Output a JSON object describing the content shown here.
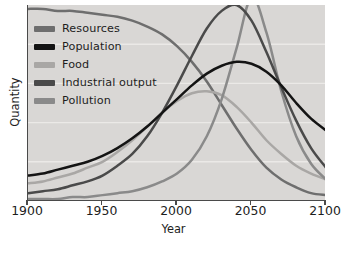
{
  "figure": {
    "background_color": "#ffffff",
    "plot_background_color": "#d9d7d5",
    "axis_color": "#4a4a4a",
    "gridline_color": "#ebe9e7"
  },
  "chart_data": {
    "type": "line",
    "title": "",
    "subtitle": "",
    "xlabel": "Year",
    "ylabel": "Quantity",
    "xlim": [
      1900,
      2100
    ],
    "ylim": [
      0,
      100
    ],
    "xticks": [
      1900,
      1950,
      2000,
      2050,
      2100
    ],
    "xtick_labels": [
      "1900",
      "1950",
      "2000",
      "2050",
      "2100"
    ],
    "yticks": [],
    "ytick_labels": [],
    "grid": true,
    "grid_axis": "y",
    "legend_position": "upper-left",
    "x": [
      1900,
      1910,
      1920,
      1930,
      1940,
      1950,
      1960,
      1970,
      1980,
      1990,
      2000,
      2010,
      2020,
      2030,
      2040,
      2050,
      2060,
      2070,
      2080,
      2090,
      2100
    ],
    "series": [
      {
        "name": "Resources",
        "color": "#6e6e6e",
        "values": [
          98,
          98,
          97,
          97,
          96,
          95,
          94,
          92,
          89,
          85,
          79,
          71,
          61,
          49,
          37,
          26,
          17,
          11,
          7,
          4,
          3
        ]
      },
      {
        "name": "Population",
        "color": "#141414",
        "values": [
          13,
          14,
          16,
          18,
          20,
          23,
          27,
          32,
          38,
          45,
          52,
          59,
          65,
          69,
          71,
          70,
          66,
          59,
          50,
          42,
          36
        ]
      },
      {
        "name": "Food",
        "color": "#a9a7a5",
        "values": [
          9,
          10,
          12,
          14,
          17,
          20,
          25,
          31,
          38,
          45,
          51,
          55,
          56,
          54,
          48,
          40,
          31,
          24,
          18,
          14,
          11
        ]
      },
      {
        "name": "Industrial output",
        "color": "#4a4a4a",
        "values": [
          4,
          5,
          6,
          8,
          10,
          13,
          18,
          24,
          33,
          45,
          59,
          74,
          88,
          97,
          100,
          92,
          76,
          58,
          41,
          27,
          17
        ]
      },
      {
        "name": "Pollution",
        "color": "#8a8a8a",
        "values": [
          1,
          1,
          1,
          2,
          2,
          3,
          4,
          5,
          7,
          10,
          14,
          21,
          33,
          52,
          78,
          104,
          86,
          56,
          33,
          19,
          11
        ]
      }
    ]
  },
  "legend": {
    "items": [
      {
        "label": "Resources",
        "color": "#6e6e6e"
      },
      {
        "label": "Population",
        "color": "#141414"
      },
      {
        "label": "Food",
        "color": "#a9a7a5"
      },
      {
        "label": "Industrial output",
        "color": "#4a4a4a"
      },
      {
        "label": "Pollution",
        "color": "#8a8a8a"
      }
    ]
  },
  "axes": {
    "x_title": "Year",
    "y_title": "Quantity",
    "x_labels": [
      "1900",
      "1950",
      "2000",
      "2050",
      "2100"
    ]
  }
}
